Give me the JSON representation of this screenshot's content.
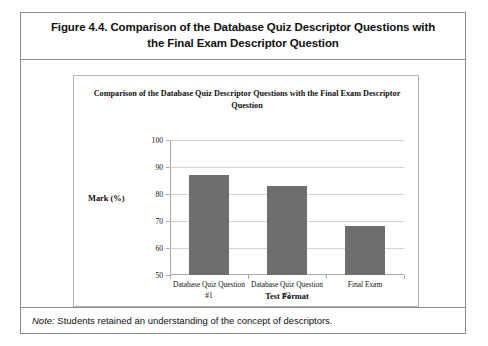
{
  "figure": {
    "caption": "Figure 4.4. Comparison of the Database Quiz Descriptor Questions with the Final Exam Descriptor Question",
    "note_lead": "Note:",
    "note_body": " Students retained an understanding of the concept of descriptors."
  },
  "chart_data": {
    "type": "bar",
    "title": "Comparison of the Database Quiz Descriptor Questions with the Final Exam Descriptor Question",
    "categories": [
      "Database Quiz Question #1",
      "Database Quiz Question #2",
      "Final Exam"
    ],
    "values": [
      87,
      83,
      68
    ],
    "xlabel": "Test Format",
    "ylabel": "Mark (%)",
    "ylim": [
      50,
      100
    ],
    "ytick_labels": [
      "100",
      "90",
      "80",
      "70",
      "60",
      "50"
    ],
    "ytick_values": [
      100,
      90,
      80,
      70,
      60,
      50
    ],
    "grid": true,
    "legend": "none",
    "bar_color": "#6e6e6e",
    "gridline_color": "#d2d2d2",
    "axis_color": "#a8a8a8"
  }
}
